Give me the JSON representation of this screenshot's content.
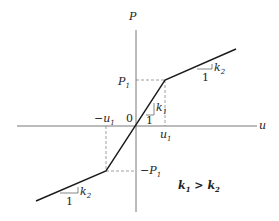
{
  "diagram": {
    "type": "bilinear-force-displacement",
    "colors": {
      "line": "#1a1a1a",
      "axis": "#555555",
      "dash": "#777777",
      "text": "#222222"
    },
    "axes": {
      "x_label": "u",
      "y_label": "P",
      "origin_label": "0"
    },
    "breakpoints": {
      "pos_u": "u",
      "pos_u_sub": "1",
      "neg_u": "−u",
      "neg_u_sub": "1",
      "pos_P": "P",
      "pos_P_sub": "1",
      "neg_P": "−P",
      "neg_P_sub": "1"
    },
    "slopes": {
      "inner": {
        "rise": "k",
        "rise_sub": "1",
        "run": "1"
      },
      "upper": {
        "rise": "k",
        "rise_sub": "2",
        "run": "1"
      },
      "lower": {
        "rise": "k",
        "rise_sub": "2",
        "run": "1"
      }
    },
    "condition": {
      "left": "k",
      "left_sub": "1",
      "op": " > ",
      "right": "k",
      "right_sub": "2"
    }
  }
}
